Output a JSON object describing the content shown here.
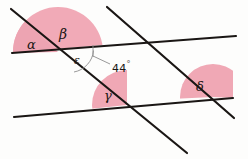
{
  "figure": {
    "background_color": "#fdfdfc",
    "line_color": "#1a1614",
    "shade_color": "#f0a7b5",
    "shade_color_light": "#f2b3be",
    "arc_color": "#8d8d8d"
  },
  "labels": {
    "alpha": "α",
    "beta": "β",
    "gamma": "γ",
    "delta": "δ",
    "epsilon": "ε"
  },
  "measurement": {
    "value": "44",
    "unit": "°",
    "full": "44°",
    "refers_to": "epsilon"
  },
  "geometry": {
    "lines": [
      {
        "name": "upper-parallel-line",
        "role": "parallel",
        "x1": 12,
        "y1": 53,
        "x2": 236,
        "y2": 36
      },
      {
        "name": "lower-parallel-line",
        "role": "parallel",
        "x1": 14,
        "y1": 117,
        "x2": 233,
        "y2": 98
      },
      {
        "name": "left-transversal-line",
        "role": "transversal",
        "x1": 11,
        "y1": 9,
        "x2": 187,
        "y2": 153
      },
      {
        "name": "right-transversal-line",
        "role": "transversal",
        "x1": 107,
        "y1": 7,
        "x2": 234,
        "y2": 118
      }
    ],
    "intersections": [
      {
        "name": "upper-left-vertex",
        "x": 58,
        "y": 52
      },
      {
        "name": "upper-right-vertex",
        "x": 152,
        "y": 43
      },
      {
        "name": "lower-left-vertex",
        "x": 127,
        "y": 105
      },
      {
        "name": "lower-right-vertex",
        "x": 213,
        "y": 97
      }
    ],
    "angles": [
      {
        "name": "angle-alpha",
        "label": "α",
        "vertex": "upper-left-vertex",
        "shaded": true
      },
      {
        "name": "angle-beta",
        "label": "β",
        "vertex": "upper-left-vertex",
        "shaded": true
      },
      {
        "name": "angle-gamma",
        "label": "γ",
        "vertex": "lower-left-vertex",
        "shaded": true
      },
      {
        "name": "angle-delta",
        "label": "δ",
        "vertex": "lower-right-vertex",
        "shaded": true
      },
      {
        "name": "angle-epsilon",
        "label": "ε",
        "vertex": "upper-left-vertex",
        "shaded": false,
        "measure": "44°"
      }
    ]
  }
}
